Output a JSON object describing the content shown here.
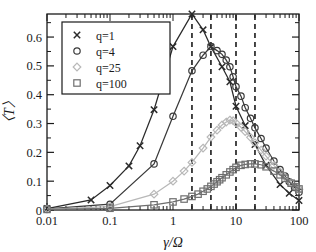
{
  "chart_data": {
    "type": "scatter",
    "title": "",
    "xlabel": "γ/Ω",
    "ylabel": "〈T〉",
    "xscale": "log",
    "xlim": [
      0.01,
      100
    ],
    "ylim": [
      0,
      0.68
    ],
    "grid": false,
    "legend_position": "top-left",
    "xticks": [
      0.01,
      0.1,
      1,
      10,
      100
    ],
    "xticklabels": [
      "0.01",
      "0.1",
      "1",
      "10",
      "100"
    ],
    "yticks": [
      0,
      0.1,
      0.2,
      0.3,
      0.4,
      0.5,
      0.6
    ],
    "yticklabels": [
      "0",
      "0.1",
      "0.2",
      "0.3",
      "0.4",
      "0.5",
      "0.6"
    ],
    "vlines": [
      2,
      4,
      10,
      20
    ],
    "vline_style": "dashed",
    "series": [
      {
        "name": "q=1",
        "marker": "x",
        "color": "#2b2b2b",
        "x": [
          0.01,
          0.05,
          0.1,
          0.2,
          0.3,
          0.5,
          1.0,
          2.0,
          3.0,
          4.0,
          6.0,
          8.0,
          10.0,
          14.0,
          20.0,
          30.0,
          50.0,
          70.0,
          100.0
        ],
        "y": [
          0.005,
          0.035,
          0.085,
          0.153,
          0.223,
          0.348,
          0.567,
          0.68,
          0.625,
          0.566,
          0.497,
          0.445,
          0.36,
          0.293,
          0.227,
          0.155,
          0.088,
          0.058,
          0.033
        ]
      },
      {
        "name": "q=4",
        "marker": "o",
        "color": "#3a3a3a",
        "x": [
          0.01,
          0.1,
          0.5,
          1.0,
          2.0,
          3.0,
          4.0,
          5.0,
          6.0,
          7.0,
          8.0,
          9.0,
          10.0,
          12.0,
          14.0,
          17.0,
          20.0,
          25.0,
          30.0,
          40.0,
          50.0,
          60.0,
          70.0,
          85.0,
          100.0
        ],
        "y": [
          0.004,
          0.02,
          0.16,
          0.325,
          0.483,
          0.537,
          0.567,
          0.553,
          0.54,
          0.52,
          0.497,
          0.462,
          0.428,
          0.395,
          0.355,
          0.318,
          0.285,
          0.248,
          0.215,
          0.17,
          0.14,
          0.118,
          0.098,
          0.078,
          0.062
        ]
      },
      {
        "name": "q=25",
        "marker": "d",
        "color": "#b8b8b8",
        "x": [
          0.01,
          0.1,
          0.5,
          1.0,
          1.5,
          2.0,
          3.0,
          4.0,
          5.0,
          6.0,
          7.0,
          8.0,
          9.0,
          10.0,
          12.0,
          14.0,
          17.0,
          20.0,
          25.0,
          30.0,
          40.0,
          50.0,
          60.0,
          75.0,
          90.0,
          100.0
        ],
        "y": [
          0.003,
          0.012,
          0.055,
          0.1,
          0.135,
          0.165,
          0.215,
          0.253,
          0.277,
          0.295,
          0.305,
          0.312,
          0.31,
          0.302,
          0.287,
          0.272,
          0.252,
          0.233,
          0.208,
          0.187,
          0.155,
          0.132,
          0.114,
          0.095,
          0.08,
          0.072
        ]
      },
      {
        "name": "q=100",
        "marker": "s",
        "color": "#6e6e6e",
        "x": [
          0.01,
          0.1,
          0.5,
          1.0,
          1.5,
          2.0,
          2.5,
          3.0,
          3.5,
          4.0,
          4.5,
          5.0,
          5.5,
          6.0,
          7.0,
          8.0,
          9.0,
          10.0,
          12.0,
          14.0,
          17.0,
          20.0,
          25.0,
          30.0,
          40.0,
          50.0,
          60.0,
          75.0,
          90.0,
          100.0
        ],
        "y": [
          0.002,
          0.006,
          0.018,
          0.028,
          0.038,
          0.047,
          0.055,
          0.065,
          0.073,
          0.082,
          0.09,
          0.098,
          0.105,
          0.112,
          0.122,
          0.132,
          0.14,
          0.148,
          0.155,
          0.158,
          0.16,
          0.16,
          0.157,
          0.15,
          0.135,
          0.122,
          0.11,
          0.093,
          0.08,
          0.073
        ]
      }
    ]
  },
  "legend": {
    "entries": [
      {
        "label": "q=1",
        "marker": "x"
      },
      {
        "label": "q=4",
        "marker": "o"
      },
      {
        "label": "q=25",
        "marker": "d"
      },
      {
        "label": "q=100",
        "marker": "s"
      }
    ]
  },
  "axes": {
    "x_label": "γ/Ω",
    "y_label": "〈T〉"
  }
}
